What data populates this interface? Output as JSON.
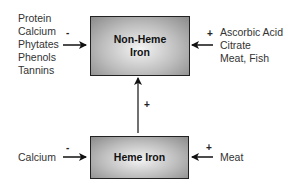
{
  "diagram": {
    "non_heme_box": {
      "line1": "Non-Heme",
      "line2": "Iron"
    },
    "heme_box": {
      "label": "Heme Iron"
    },
    "non_heme_inhibitors": {
      "sign": "-",
      "items": [
        "Protein",
        "Calcium",
        "Phytates",
        "Phenols",
        "Tannins"
      ]
    },
    "non_heme_enhancers": {
      "sign": "+",
      "items": [
        "Ascorbic Acid",
        "Citrate",
        "Meat, Fish"
      ]
    },
    "heme_to_non_heme": {
      "sign": "+"
    },
    "heme_inhibitors": {
      "sign": "-",
      "items": [
        "Calcium"
      ]
    },
    "heme_enhancers": {
      "sign": "+",
      "items": [
        "Meat"
      ]
    }
  }
}
